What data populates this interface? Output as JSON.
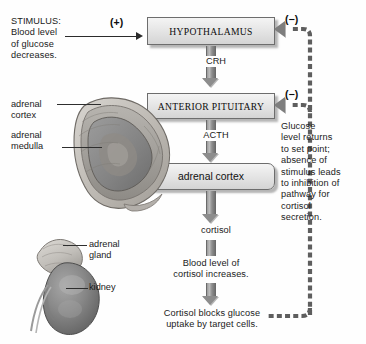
{
  "diagram": {
    "stimulus": {
      "label": "STIMULUS:\nBlood level\nof glucose\ndecreases.",
      "sign": "(+)"
    },
    "boxes": [
      {
        "id": "hypothalamus",
        "label": "HYPOTHALAMUS"
      },
      {
        "id": "anterior-pituitary",
        "label": "ANTERIOR PITUITARY"
      },
      {
        "id": "adrenal-cortex",
        "label": "adrenal cortex"
      }
    ],
    "hormones": [
      {
        "id": "crh",
        "label": "CRH"
      },
      {
        "id": "acth",
        "label": "ACTH"
      },
      {
        "id": "cortisol",
        "label": "cortisol"
      }
    ],
    "results": [
      {
        "id": "blood-cortisol",
        "label": "Blood level of\ncortisol increases."
      },
      {
        "id": "cortisol-blocks",
        "label": "Cortisol blocks glucose\nuptake by target cells."
      }
    ],
    "feedback": {
      "text": "Glucose\nlevel returns\nto set point;\nabsence of\nstimulus leads\nto inhibition of\npathway for\ncortisol\nsecretion.",
      "sign_upper": "(−)",
      "sign_lower": "(−)"
    },
    "anatomy_labels": [
      {
        "id": "adrenal-cortex-label",
        "label": "adrenal\ncortex"
      },
      {
        "id": "adrenal-medulla-label",
        "label": "adrenal\nmedulla"
      },
      {
        "id": "adrenal-gland-label",
        "label": "adrenal\ngland"
      },
      {
        "id": "kidney-label",
        "label": "kidney"
      }
    ],
    "colors": {
      "box_fill": "#e3e3e3",
      "box_border": "#6d6d6d",
      "arrow_gray": "#8d8d8d",
      "feedback_line": "#5a5a5a",
      "text": "#1a1a1a",
      "background": "#fefefe"
    }
  }
}
